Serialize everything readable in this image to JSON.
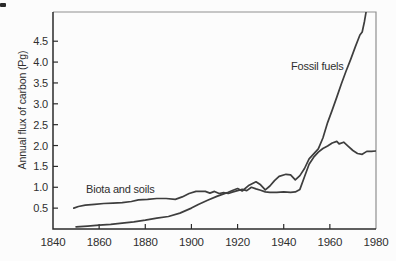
{
  "page": {
    "background": "#fcfcfc"
  },
  "chart_data": {
    "type": "line",
    "title": "",
    "xlabel": "",
    "ylabel": "Annual flux of carbon (Pg)",
    "xlim": [
      1840,
      1980
    ],
    "ylim": [
      0,
      5.2
    ],
    "x_tick_labels": [
      "1840",
      "1860",
      "1880",
      "1900",
      "1920",
      "1940",
      "1960",
      "1980"
    ],
    "x_tick_values": [
      1840,
      1860,
      1880,
      1900,
      1920,
      1940,
      1960,
      1980
    ],
    "x_tick_marks": [
      1860,
      1880,
      1900,
      1920,
      1940,
      1960
    ],
    "y_tick_labels": [
      "0.5",
      "1.0",
      "1.5",
      "2.0",
      "2.5",
      "3.0",
      "3.5",
      "4.0",
      "4.5"
    ],
    "grid": false,
    "legend": "inline curve annotations",
    "line_color": "#3e3e3e",
    "frame_color": "#8f8f8f",
    "axis_color": "#2b2b2b",
    "text_color": "#2f2f2f",
    "series": [
      {
        "name": "Fossil fuels",
        "points": [
          [
            1850,
            0.05
          ],
          [
            1855,
            0.07
          ],
          [
            1860,
            0.09
          ],
          [
            1865,
            0.11
          ],
          [
            1870,
            0.14
          ],
          [
            1875,
            0.17
          ],
          [
            1880,
            0.21
          ],
          [
            1885,
            0.26
          ],
          [
            1890,
            0.3
          ],
          [
            1895,
            0.38
          ],
          [
            1900,
            0.5
          ],
          [
            1903,
            0.59
          ],
          [
            1907,
            0.69
          ],
          [
            1911,
            0.78
          ],
          [
            1914,
            0.84
          ],
          [
            1916,
            0.88
          ],
          [
            1918,
            0.93
          ],
          [
            1920,
            0.97
          ],
          [
            1922,
            0.91
          ],
          [
            1925,
            1.05
          ],
          [
            1928,
            1.13
          ],
          [
            1930,
            1.06
          ],
          [
            1932,
            0.94
          ],
          [
            1934,
            1.03
          ],
          [
            1936,
            1.16
          ],
          [
            1938,
            1.26
          ],
          [
            1941,
            1.31
          ],
          [
            1943,
            1.3
          ],
          [
            1945,
            1.18
          ],
          [
            1947,
            1.28
          ],
          [
            1949,
            1.45
          ],
          [
            1951,
            1.68
          ],
          [
            1953,
            1.8
          ],
          [
            1955,
            1.92
          ],
          [
            1957,
            2.18
          ],
          [
            1959,
            2.55
          ],
          [
            1961,
            2.85
          ],
          [
            1963,
            3.16
          ],
          [
            1965,
            3.48
          ],
          [
            1967,
            3.78
          ],
          [
            1969,
            4.06
          ],
          [
            1971,
            4.36
          ],
          [
            1973,
            4.65
          ],
          [
            1974,
            4.72
          ],
          [
            1975,
            4.98
          ],
          [
            1976,
            5.3
          ]
        ]
      },
      {
        "name": "Biota and soils",
        "points": [
          [
            1849,
            0.5
          ],
          [
            1851,
            0.54
          ],
          [
            1854,
            0.57
          ],
          [
            1858,
            0.59
          ],
          [
            1862,
            0.61
          ],
          [
            1866,
            0.62
          ],
          [
            1870,
            0.63
          ],
          [
            1874,
            0.66
          ],
          [
            1877,
            0.7
          ],
          [
            1881,
            0.71
          ],
          [
            1885,
            0.73
          ],
          [
            1889,
            0.73
          ],
          [
            1893,
            0.71
          ],
          [
            1896,
            0.77
          ],
          [
            1899,
            0.85
          ],
          [
            1902,
            0.9
          ],
          [
            1906,
            0.9
          ],
          [
            1908,
            0.86
          ],
          [
            1910,
            0.9
          ],
          [
            1912,
            0.85
          ],
          [
            1914,
            0.87
          ],
          [
            1916,
            0.85
          ],
          [
            1918,
            0.89
          ],
          [
            1920,
            0.92
          ],
          [
            1922,
            0.95
          ],
          [
            1924,
            0.92
          ],
          [
            1926,
            1.0
          ],
          [
            1928,
            0.96
          ],
          [
            1930,
            0.93
          ],
          [
            1932,
            0.89
          ],
          [
            1934,
            0.88
          ],
          [
            1937,
            0.88
          ],
          [
            1940,
            0.89
          ],
          [
            1943,
            0.88
          ],
          [
            1945,
            0.89
          ],
          [
            1947,
            0.95
          ],
          [
            1949,
            1.25
          ],
          [
            1951,
            1.55
          ],
          [
            1953,
            1.72
          ],
          [
            1955,
            1.84
          ],
          [
            1957,
            1.93
          ],
          [
            1959,
            1.99
          ],
          [
            1961,
            2.06
          ],
          [
            1963,
            2.1
          ],
          [
            1964,
            2.04
          ],
          [
            1966,
            2.08
          ],
          [
            1968,
            1.98
          ],
          [
            1970,
            1.88
          ],
          [
            1972,
            1.81
          ],
          [
            1974,
            1.79
          ],
          [
            1976,
            1.86
          ],
          [
            1978,
            1.86
          ],
          [
            1980,
            1.87
          ]
        ]
      }
    ]
  }
}
